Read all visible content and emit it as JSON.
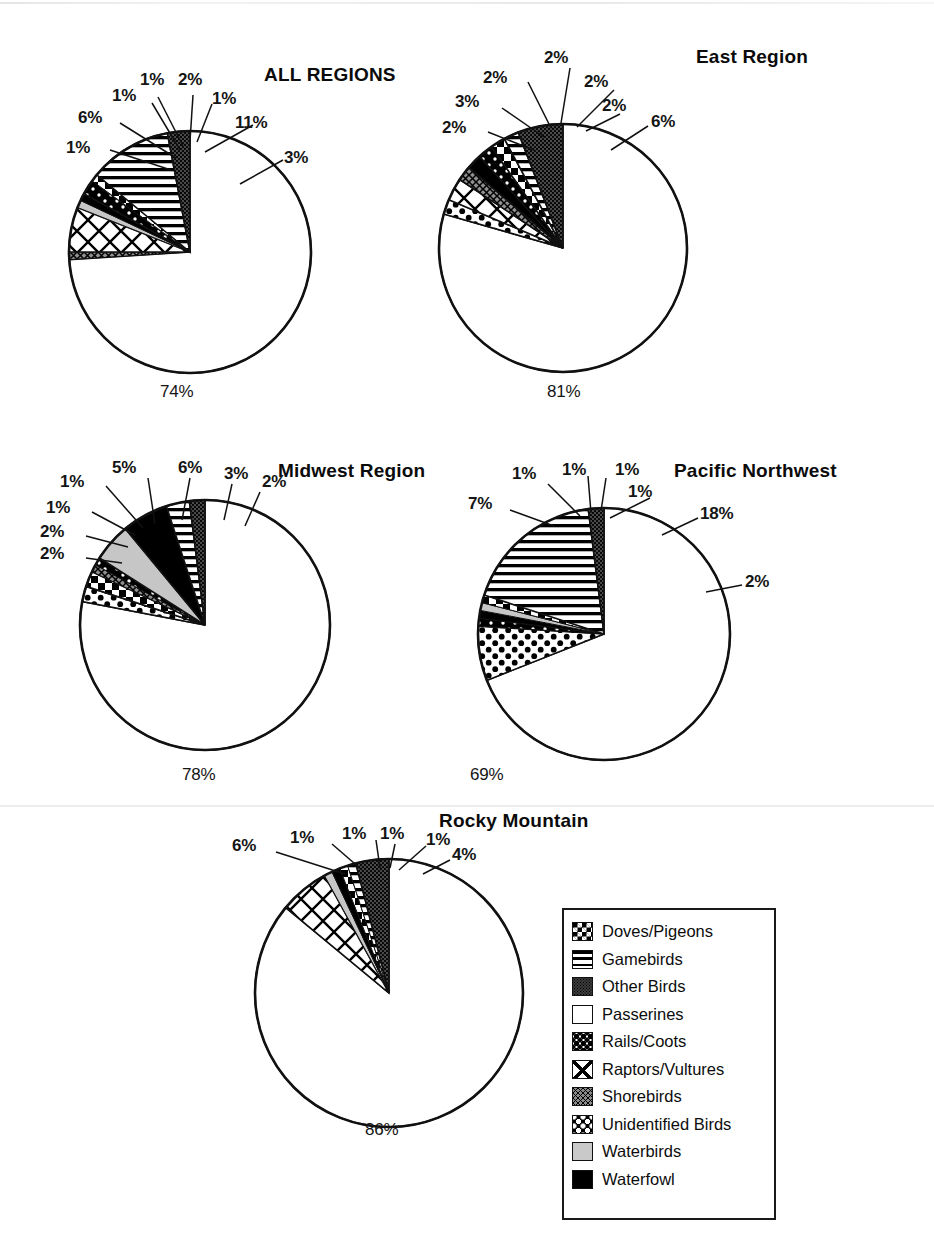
{
  "figure": {
    "legend_title": "",
    "legend_box_label": "bird-group-legend"
  },
  "legend": {
    "items": [
      {
        "label": "Doves/Pigeons",
        "key": "doves",
        "swatch": "checkerboard-swatch"
      },
      {
        "label": "Gamebirds",
        "key": "gamebirds",
        "swatch": "horizontal-lines-swatch"
      },
      {
        "label": "Other Birds",
        "key": "other",
        "swatch": "dark-stipple-swatch"
      },
      {
        "label": "Passerines",
        "key": "passerines",
        "swatch": "white-swatch"
      },
      {
        "label": "Rails/Coots",
        "key": "rails",
        "swatch": "coarse-dots-swatch"
      },
      {
        "label": "Raptors/Vultures",
        "key": "raptors",
        "swatch": "large-crosshatch-swatch"
      },
      {
        "label": "Shorebirds",
        "key": "shorebirds",
        "swatch": "fine-crosshatch-swatch"
      },
      {
        "label": "Unidentified Birds",
        "key": "unidentified",
        "swatch": "black-dots-swatch"
      },
      {
        "label": "Waterbirds",
        "key": "waterbirds",
        "swatch": "light-gray-swatch"
      },
      {
        "label": "Waterfowl",
        "key": "waterfowl",
        "swatch": "solid-black-swatch"
      }
    ]
  },
  "chart_data": [
    {
      "type": "pie",
      "title": "ALL REGIONS",
      "panel": "all-regions",
      "categories": [
        "Passerines",
        "Shorebirds",
        "Raptors/Vultures",
        "Waterbirds",
        "Waterfowl",
        "Unidentified Birds",
        "Doves/Pigeons",
        "Gamebirds",
        "Other Birds"
      ],
      "values": [
        74,
        1,
        6,
        1,
        1,
        2,
        1,
        11,
        3
      ],
      "labels": [
        "74%",
        "1%",
        "6%",
        "1%",
        "1%",
        "2%",
        "1%",
        "11%",
        "3%"
      ],
      "big_slice_label": "74%",
      "legend_position": "bottom-right-shared"
    },
    {
      "type": "pie",
      "title": "East Region",
      "panel": "east-region",
      "categories": [
        "Passerines",
        "Rails/Coots",
        "Raptors/Vultures",
        "Shorebirds",
        "Waterfowl",
        "Unidentified Birds",
        "Doves/Pigeons",
        "Gamebirds",
        "Other Birds"
      ],
      "values": [
        81,
        2,
        3,
        2,
        2,
        2,
        2,
        2,
        6
      ],
      "labels": [
        "81%",
        "2%",
        "3%",
        "2%",
        "2%",
        "2%",
        "2%",
        "2%",
        "6%"
      ],
      "big_slice_label": "81%",
      "legend_position": "bottom-right-shared"
    },
    {
      "type": "pie",
      "title": "Midwest Region",
      "panel": "midwest-region",
      "categories": [
        "Passerines",
        "Rails/Coots",
        "Doves/Pigeons",
        "Shorebirds",
        "Unidentified Birds",
        "Waterbirds",
        "Waterfowl",
        "Gamebirds",
        "Other Birds"
      ],
      "values": [
        78,
        2,
        2,
        1,
        1,
        5,
        6,
        3,
        2
      ],
      "labels": [
        "78%",
        "2%",
        "2%",
        "1%",
        "1%",
        "5%",
        "6%",
        "3%",
        "2%"
      ],
      "big_slice_label": "78%",
      "legend_position": "bottom-right-shared"
    },
    {
      "type": "pie",
      "title": "Pacific Northwest",
      "panel": "pacific-northwest",
      "categories": [
        "Passerines",
        "Rails/Coots",
        "Unidentified Birds",
        "Waterfowl",
        "Waterbirds",
        "Doves/Pigeons",
        "Gamebirds",
        "Other Birds"
      ],
      "values": [
        69,
        7,
        1,
        1,
        1,
        1,
        18,
        2
      ],
      "labels": [
        "69%",
        "7%",
        "1%",
        "1%",
        "1%",
        "1%",
        "18%",
        "2%"
      ],
      "big_slice_label": "69%",
      "legend_position": "bottom-right-shared"
    },
    {
      "type": "pie",
      "title": "Rocky Mountain",
      "panel": "rocky-mountain",
      "categories": [
        "Passerines",
        "Raptors/Vultures",
        "Waterbirds",
        "Waterfowl",
        "Doves/Pigeons",
        "Gamebirds",
        "Other Birds"
      ],
      "values": [
        86,
        6,
        1,
        1,
        1,
        1,
        4
      ],
      "labels": [
        "86%",
        "6%",
        "1%",
        "1%",
        "1%",
        "1%",
        "4%"
      ],
      "big_slice_label": "86%",
      "legend_position": "bottom-right-shared"
    }
  ],
  "panels": {
    "all_regions": {
      "title": "ALL REGIONS",
      "bottom_label": "74%",
      "callouts": [
        "1%",
        "6%",
        "1%",
        "1%",
        "2%",
        "1%",
        "11%",
        "3%"
      ]
    },
    "east_region": {
      "title": "East Region",
      "bottom_label": "81%",
      "callouts": [
        "2%",
        "3%",
        "2%",
        "2%",
        "2%",
        "2%",
        "6%"
      ]
    },
    "midwest_region": {
      "title": "Midwest Region",
      "bottom_label": "78%",
      "callouts": [
        "2%",
        "2%",
        "1%",
        "1%",
        "5%",
        "6%",
        "3%",
        "2%"
      ]
    },
    "pacific_northwest": {
      "title": "Pacific Northwest",
      "bottom_label": "69%",
      "callouts": [
        "7%",
        "1%",
        "1%",
        "1%",
        "1%",
        "18%",
        "2%"
      ]
    },
    "rocky_mountain": {
      "title": "Rocky Mountain",
      "bottom_label": "86%",
      "callouts": [
        "6%",
        "1%",
        "1%",
        "1%",
        "1%",
        "4%"
      ]
    }
  }
}
